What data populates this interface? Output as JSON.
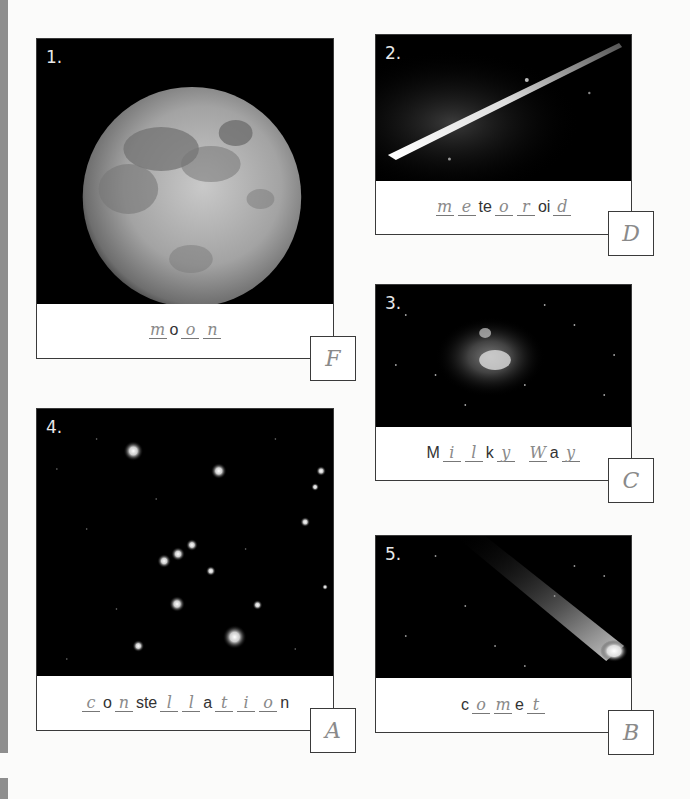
{
  "worksheet": {
    "cards": [
      {
        "number": "1.",
        "image": "moon-photo",
        "word_parts": [
          {
            "type": "blank",
            "text": "m"
          },
          {
            "type": "print",
            "text": "o"
          },
          {
            "type": "blank",
            "text": "o"
          },
          {
            "type": "blank",
            "text": "n"
          }
        ],
        "answer_letter": "F"
      },
      {
        "number": "2.",
        "image": "meteoroid-photo",
        "word_parts": [
          {
            "type": "blank",
            "text": "m"
          },
          {
            "type": "blank",
            "text": "e"
          },
          {
            "type": "print",
            "text": "te"
          },
          {
            "type": "blank",
            "text": "o"
          },
          {
            "type": "blank",
            "text": "r"
          },
          {
            "type": "print",
            "text": "oi"
          },
          {
            "type": "blank",
            "text": "d"
          }
        ],
        "answer_letter": "D"
      },
      {
        "number": "3.",
        "image": "milky-way-photo",
        "word_parts": [
          {
            "type": "print",
            "text": "M"
          },
          {
            "type": "blank",
            "text": "i"
          },
          {
            "type": "blank",
            "text": "l"
          },
          {
            "type": "print",
            "text": "k"
          },
          {
            "type": "blank",
            "text": "y"
          },
          {
            "type": "space",
            "text": " "
          },
          {
            "type": "blank",
            "text": "W"
          },
          {
            "type": "print",
            "text": "a"
          },
          {
            "type": "blank",
            "text": "y"
          }
        ],
        "answer_letter": "C"
      },
      {
        "number": "4.",
        "image": "constellation-photo",
        "word_parts": [
          {
            "type": "blank",
            "text": "c"
          },
          {
            "type": "print",
            "text": "o"
          },
          {
            "type": "blank",
            "text": "n"
          },
          {
            "type": "print",
            "text": "ste"
          },
          {
            "type": "blank",
            "text": "l"
          },
          {
            "type": "blank",
            "text": "l"
          },
          {
            "type": "print",
            "text": "a"
          },
          {
            "type": "blank",
            "text": "t"
          },
          {
            "type": "blank",
            "text": "i"
          },
          {
            "type": "blank",
            "text": "o"
          },
          {
            "type": "print",
            "text": "n"
          }
        ],
        "answer_letter": "A"
      },
      {
        "number": "5.",
        "image": "comet-photo",
        "word_parts": [
          {
            "type": "print",
            "text": "c"
          },
          {
            "type": "blank",
            "text": "o"
          },
          {
            "type": "blank",
            "text": "m"
          },
          {
            "type": "print",
            "text": "e"
          },
          {
            "type": "blank",
            "text": "t"
          }
        ],
        "answer_letter": "B"
      }
    ]
  }
}
